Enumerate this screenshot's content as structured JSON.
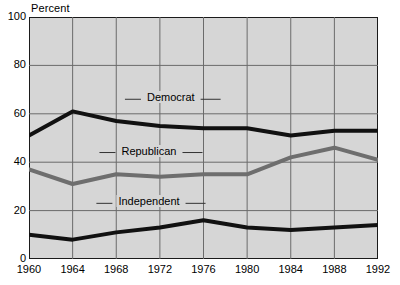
{
  "chart_data": {
    "type": "line",
    "title": "",
    "ylabel": "Percent",
    "xlabel": "",
    "ylim": [
      0,
      100
    ],
    "xlim": [
      1960,
      1992
    ],
    "grid": true,
    "legend_position": "inline-labels",
    "yticks": [
      0,
      20,
      40,
      60,
      80,
      100
    ],
    "xticks": [
      1960,
      1964,
      1968,
      1972,
      1976,
      1980,
      1984,
      1988,
      1992
    ],
    "x": [
      1960,
      1964,
      1968,
      1972,
      1976,
      1980,
      1984,
      1988,
      1992
    ],
    "series": [
      {
        "name": "Democrat",
        "color": "#111111",
        "values": [
          51,
          61,
          57,
          55,
          54,
          54,
          51,
          53,
          53
        ]
      },
      {
        "name": "Republican",
        "color": "#6e6e6e",
        "values": [
          37,
          31,
          35,
          34,
          35,
          35,
          42,
          46,
          41
        ]
      },
      {
        "name": "Independent",
        "color": "#111111",
        "values": [
          10,
          8,
          11,
          13,
          16,
          13,
          12,
          13,
          14
        ]
      }
    ],
    "annotations": [
      {
        "text": "Democrat",
        "x": 1973,
        "y": 66
      },
      {
        "text": "Republican",
        "x": 1971,
        "y": 44
      },
      {
        "text": "Independent",
        "x": 1971,
        "y": 23
      }
    ]
  }
}
